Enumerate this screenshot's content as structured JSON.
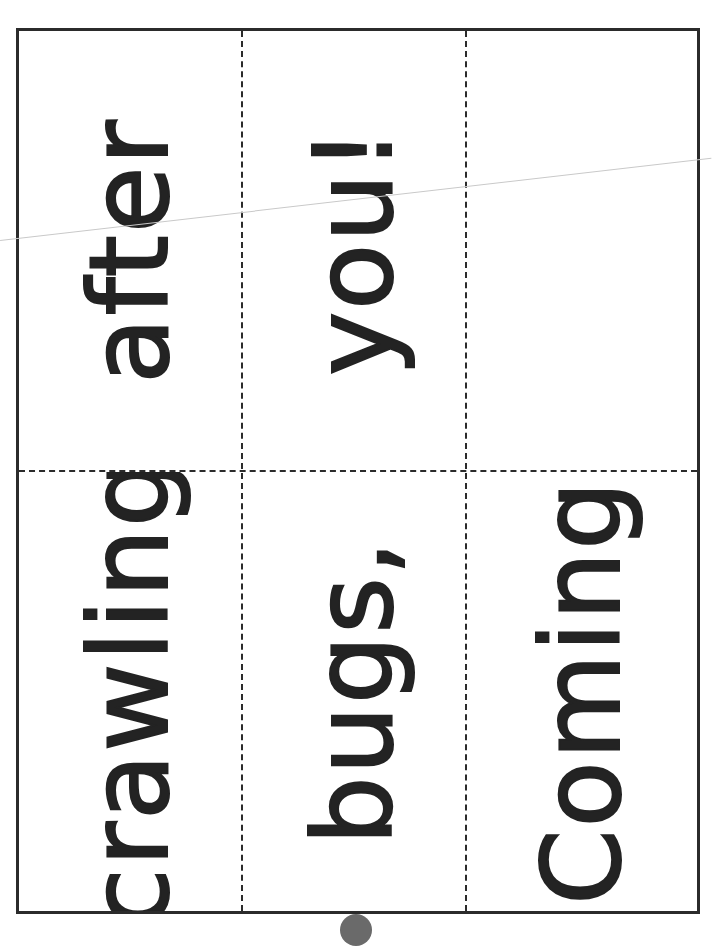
{
  "sheet": {
    "title": "Word cards",
    "layout": {
      "columns": 3,
      "rows": 2
    },
    "cells": [
      {
        "row": 0,
        "col": 0,
        "word": "after"
      },
      {
        "row": 0,
        "col": 1,
        "word": "you!"
      },
      {
        "row": 0,
        "col": 2,
        "word": ""
      },
      {
        "row": 1,
        "col": 0,
        "word": "crawling"
      },
      {
        "row": 1,
        "col": 1,
        "word": "bugs,"
      },
      {
        "row": 1,
        "col": 2,
        "word": "Coming"
      }
    ],
    "colors": {
      "ink": "#232323",
      "border": "#2b2b2b",
      "background": "#ffffff"
    }
  }
}
